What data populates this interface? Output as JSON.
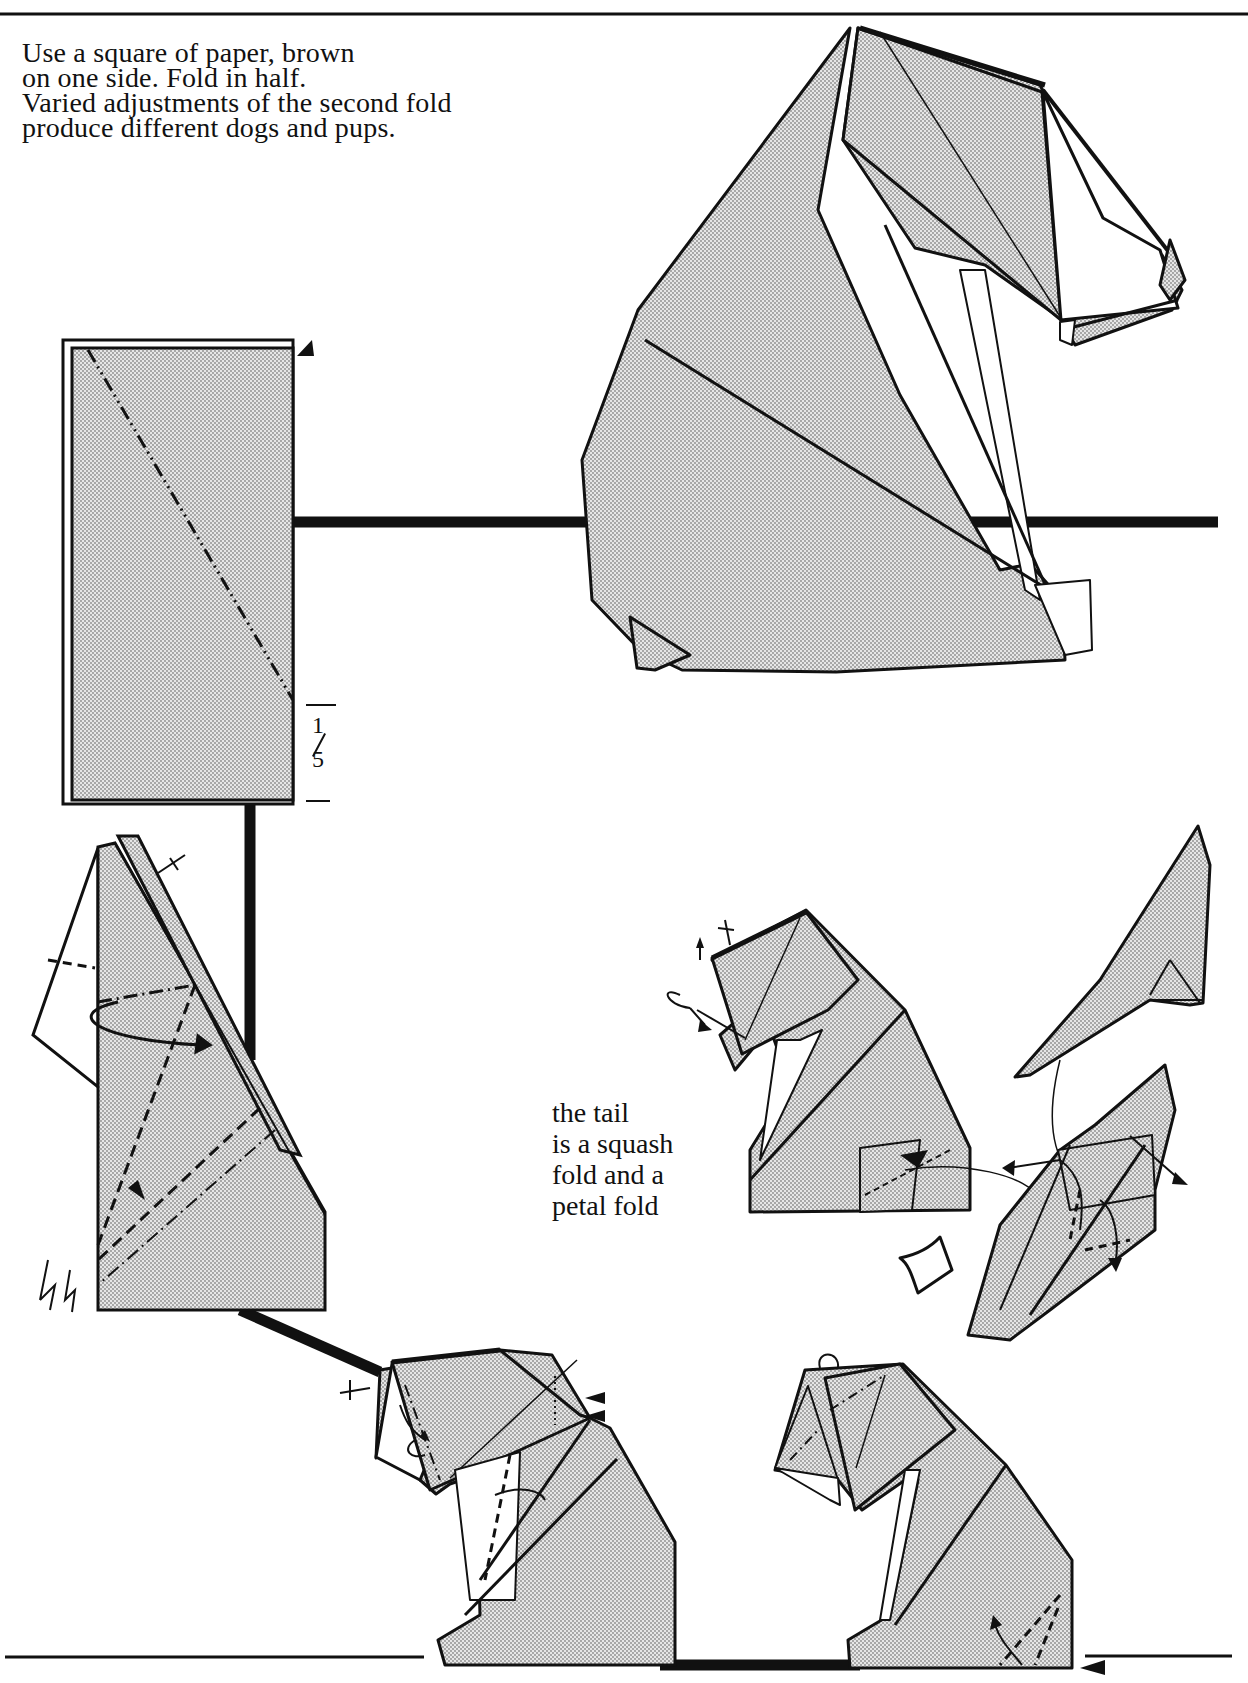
{
  "page": {
    "title_fragment": "Sitting Dog & Pup",
    "intro_lines": [
      "Use a square of paper, brown",
      "on one side. Fold in half.",
      "Varied adjustments of the second fold",
      "produce different dogs and pups."
    ],
    "fraction_label": {
      "numerator": "1",
      "denominator": "5"
    },
    "tail_note_lines": [
      "the tail",
      "is a squash",
      "fold and a",
      "petal fold"
    ]
  },
  "diagrams": [
    {
      "id": "step-1",
      "description": "folded rectangle with diagonal valley-mountain line at 1/5 mark"
    },
    {
      "id": "step-2",
      "description": "reverse fold into body with dashed crease lines and turn-over arrow"
    },
    {
      "id": "step-3",
      "description": "head forming with pleats and inside-reverse folds"
    },
    {
      "id": "step-4",
      "description": "pup shaping with tail squash and petal fold"
    },
    {
      "id": "tail-detail",
      "description": "enlarged tail squash and petal fold"
    },
    {
      "id": "final-pup",
      "description": "finished pup"
    },
    {
      "id": "final-dog",
      "description": "finished sitting dog"
    }
  ],
  "colors": {
    "ink": "#111111",
    "paper": "#ffffff",
    "stipple": "#d2d2d2"
  }
}
